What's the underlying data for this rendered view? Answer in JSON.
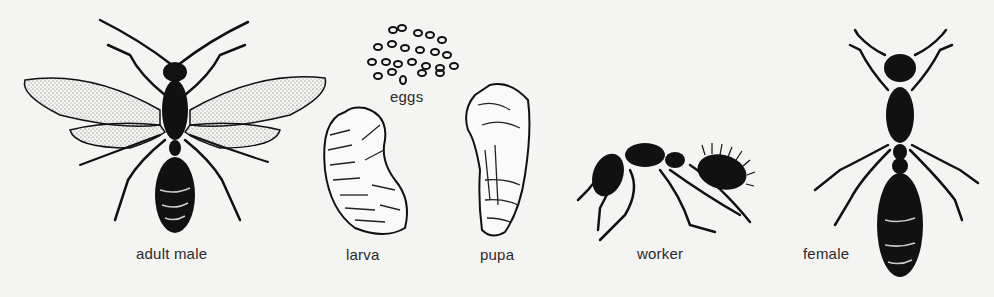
{
  "figure": {
    "stages": [
      {
        "id": "adult-male",
        "label": "adult male"
      },
      {
        "id": "eggs",
        "label": "eggs"
      },
      {
        "id": "larva",
        "label": "larva"
      },
      {
        "id": "pupa",
        "label": "pupa"
      },
      {
        "id": "worker",
        "label": "worker"
      },
      {
        "id": "female",
        "label": "female"
      }
    ],
    "colors": {
      "background": "#f4f4f2",
      "ink": "#111111",
      "wing": "#e8e8e4"
    }
  }
}
